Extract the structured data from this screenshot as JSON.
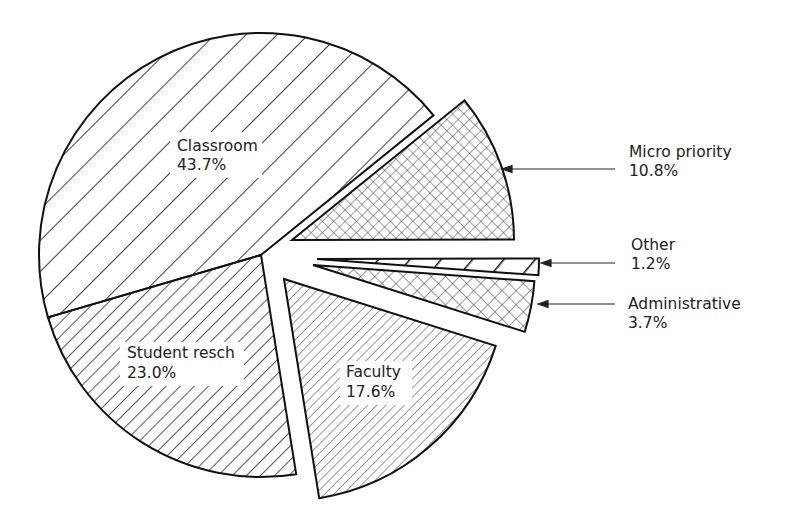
{
  "chart_data": {
    "type": "pie",
    "title": "",
    "exploded": true,
    "slices": [
      {
        "label": "Classroom",
        "value": 43.7,
        "pct_label": "43.7%",
        "pattern": "wide-diagonal",
        "offset": [
          0,
          0
        ],
        "label_pos": [
          177,
          151
        ],
        "label_box": [
          170,
          132,
          92,
          46
        ],
        "label_inside": true
      },
      {
        "label": "Student resch",
        "value": 23.0,
        "pct_label": "23.0%",
        "pattern": "diagonal",
        "offset": [
          0,
          0
        ],
        "label_pos": [
          127,
          353
        ],
        "label_box": [
          120,
          337,
          124,
          48
        ],
        "label_inside": true
      },
      {
        "label": "Faculty",
        "value": 17.6,
        "pct_label": "17.6%",
        "pattern": "fine-diagonal-gray",
        "offset": [
          23,
          24
        ],
        "label_pos": [
          347,
          376
        ],
        "label_box": [
          340,
          360,
          72,
          48
        ],
        "label_inside": true
      },
      {
        "label": "Administrative",
        "value": 3.7,
        "pct_label": "3.7%",
        "pattern": "crosshatch",
        "offset": [
          52,
          10
        ],
        "label_pos": [
          628,
          308
        ],
        "arrow": {
          "from": [
            615,
            304
          ],
          "to": [
            538,
            304
          ]
        },
        "label_inside": false
      },
      {
        "label": "Other",
        "value": 1.2,
        "pct_label": "1.2%",
        "pattern": "sparse-thick-diagonal",
        "offset": [
          56,
          4
        ],
        "label_pos": [
          630,
          248
        ],
        "arrow": {
          "from": [
            615,
            263
          ],
          "to": [
            541,
            263
          ]
        },
        "label_inside": false
      },
      {
        "label": "Micro priority",
        "value": 10.8,
        "pct_label": "10.8%",
        "pattern": "crosshatch-fine",
        "offset": [
          31,
          -15
        ],
        "label_pos": [
          628,
          157
        ],
        "arrow": {
          "from": [
            615,
            169
          ],
          "to": [
            502,
            169
          ]
        },
        "label_inside": false
      }
    ],
    "center": [
      261,
      255
    ],
    "radius": 222,
    "start_angle_deg": -39,
    "direction": "counterclockwise-from-classroom",
    "legend": "none"
  },
  "labels": {
    "classroom": {
      "name": "Classroom",
      "pct": "43.7%"
    },
    "student": {
      "name": "Student resch",
      "pct": "23.0%"
    },
    "faculty": {
      "name": "Faculty",
      "pct": "17.6%"
    },
    "admin": {
      "name": "Administrative",
      "pct": "3.7%"
    },
    "other": {
      "name": "Other",
      "pct": "1.2%"
    },
    "micro": {
      "name": "Micro priority",
      "pct": "10.8%"
    }
  }
}
